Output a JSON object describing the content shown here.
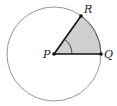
{
  "diagram": {
    "type": "circle-sector",
    "center": {
      "name": "P",
      "x": 54,
      "y": 54
    },
    "radius": 47,
    "points": [
      {
        "name": "P",
        "x": 54,
        "y": 54,
        "label_x": 43,
        "label_y": 58
      },
      {
        "name": "Q",
        "x": 101,
        "y": 54,
        "label_x": 104,
        "label_y": 58
      },
      {
        "name": "R",
        "x": 81,
        "y": 16,
        "label_x": 84,
        "label_y": 13
      }
    ],
    "sector_fill": "#cfcfcf",
    "circle_stroke": "#8a8a8a",
    "radius_stroke": "#111111",
    "angle_marker": "arc at P between PQ and PR"
  }
}
